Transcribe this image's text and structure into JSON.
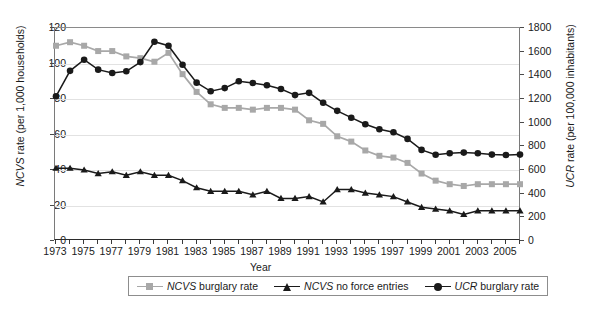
{
  "chart_data": {
    "type": "line",
    "title": "",
    "xlabel": "Year",
    "ylabel_left": "NCVS rate (per 1,000 households)",
    "ylabel_right": "UCR rate (per 100,000 inhabitants)",
    "ylabel_left_italic_prefix": "NCVS",
    "ylabel_left_rest": " rate (per 1,000 households)",
    "ylabel_right_italic_prefix": "UCR",
    "ylabel_right_rest": " rate (per 100,000 inhabitants)",
    "ylim_left": [
      0,
      120
    ],
    "ylim_right": [
      0,
      1800
    ],
    "yticks_left": [
      0,
      20,
      40,
      60,
      80,
      100,
      120
    ],
    "yticks_right": [
      0,
      200,
      400,
      600,
      800,
      1000,
      1200,
      1400,
      1600,
      1800
    ],
    "grid": "horizontal",
    "legend_position": "bottom",
    "x": [
      1973,
      1974,
      1975,
      1976,
      1977,
      1978,
      1979,
      1980,
      1981,
      1982,
      1983,
      1984,
      1985,
      1986,
      1987,
      1988,
      1989,
      1990,
      1991,
      1992,
      1993,
      1994,
      1995,
      1996,
      1997,
      1998,
      1999,
      2000,
      2001,
      2002,
      2003,
      2004,
      2005,
      2006
    ],
    "xticks_labeled": [
      1973,
      1975,
      1977,
      1979,
      1981,
      1983,
      1985,
      1987,
      1989,
      1991,
      1993,
      1995,
      1997,
      1999,
      2001,
      2003,
      2005
    ],
    "series": [
      {
        "name": "NCVS burglary rate",
        "name_italic_prefix": "NCVS",
        "name_rest": " burglary rate",
        "axis": "left",
        "marker": "square",
        "color": "#a8a8a8",
        "values": [
          110,
          112,
          110,
          107,
          107,
          104,
          103,
          101,
          106,
          94,
          84,
          77,
          75,
          75,
          74,
          75,
          75,
          74,
          68,
          66,
          59,
          56,
          51,
          48,
          47,
          44,
          38,
          34,
          32,
          31,
          32,
          32,
          32,
          32
        ]
      },
      {
        "name": "NCVS no force entries",
        "name_italic_prefix": "NCVS",
        "name_rest": " no force entries",
        "axis": "left",
        "marker": "triangle",
        "color": "#1a1a1a",
        "values": [
          41,
          41,
          40,
          38,
          39,
          37,
          39,
          37,
          37,
          34,
          30,
          28,
          28,
          28,
          26,
          28,
          24,
          24,
          25,
          22,
          29,
          29,
          27,
          26,
          25,
          22,
          19,
          18,
          17,
          15,
          17,
          17,
          17,
          17
        ]
      },
      {
        "name": "UCR burglary rate",
        "name_italic_prefix": "UCR",
        "name_rest": " burglary rate",
        "axis": "right",
        "marker": "circle",
        "color": "#1a1a1a",
        "values": [
          1223,
          1438,
          1532,
          1448,
          1420,
          1434,
          1512,
          1684,
          1650,
          1489,
          1338,
          1265,
          1292,
          1350,
          1335,
          1316,
          1284,
          1233,
          1252,
          1168,
          1100,
          1042,
          987,
          944,
          919,
          863,
          770,
          729,
          741,
          747,
          741,
          730,
          727,
          730
        ]
      }
    ]
  },
  "axes": {
    "left_ticks": [
      "0",
      "20",
      "40",
      "60",
      "80",
      "100",
      "120"
    ],
    "right_ticks": [
      "0",
      "200",
      "400",
      "600",
      "800",
      "1000",
      "1200",
      "1400",
      "1600",
      "1800"
    ],
    "x_tick_labels": [
      "1973",
      "1975",
      "1977",
      "1979",
      "1981",
      "1983",
      "1985",
      "1987",
      "1989",
      "1991",
      "1993",
      "1995",
      "1997",
      "1999",
      "2001",
      "2003",
      "2005"
    ]
  }
}
